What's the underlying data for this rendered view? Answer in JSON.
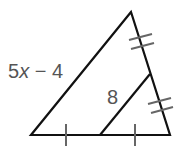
{
  "diagram": {
    "type": "triangle-midsegment",
    "colors": {
      "line": "#111111",
      "tick": "#666666",
      "label": "#555555"
    },
    "labels": {
      "left_side_coef": "5",
      "left_side_var": "x",
      "left_side_rest": " − 4",
      "midsegment": "8"
    },
    "tick_marks": {
      "bottom_side": "single tick on each half",
      "right_side": "double tick on each half"
    }
  }
}
